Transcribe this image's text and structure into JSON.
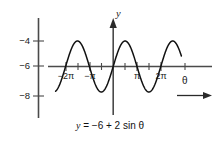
{
  "figure": {
    "caption": "y = −6 + 2 sin θ",
    "caption_parts": {
      "lhs": "y",
      "rhs": " = −6 + 2 sin ",
      "theta": "θ"
    }
  },
  "axes": {
    "y_axis_label": "y",
    "x_axis_label": "θ",
    "y_ticks": [
      {
        "label": "−4",
        "value": -4
      },
      {
        "label": "−6",
        "value": -6
      },
      {
        "label": "−8",
        "value": -8
      }
    ],
    "x_ticks": [
      {
        "label": "−2π",
        "value": -6.2832
      },
      {
        "label": "",
        "value": -4.7124
      },
      {
        "label": "−π",
        "value": -3.1416
      },
      {
        "label": "",
        "value": -1.5708
      },
      {
        "label": "",
        "value": 0
      },
      {
        "label": "",
        "value": 1.5708
      },
      {
        "label": "π",
        "value": 3.1416
      },
      {
        "label": "",
        "value": 4.7124
      },
      {
        "label": "2π",
        "value": 6.2832
      },
      {
        "label": "",
        "value": 7.854
      }
    ]
  },
  "chart_data": {
    "type": "line",
    "title": "",
    "subtitle": "",
    "equation": "y = -6 + 2 sin(theta)",
    "xlabel": "θ",
    "ylabel": "y",
    "xlim": [
      -7.6,
      9.0
    ],
    "ylim": [
      -9.2,
      -2.8
    ],
    "xtick_labels": [
      "−2π",
      "−π",
      "π",
      "2π"
    ],
    "xtick_values": [
      -6.2832,
      -3.1416,
      3.1416,
      6.2832
    ],
    "ytick_labels": [
      "−4",
      "−6",
      "−8"
    ],
    "ytick_values": [
      -4,
      -6,
      -8
    ],
    "grid": false,
    "legend": "none",
    "amplitude": 2,
    "midline": -6,
    "period": 6.2832,
    "phase": 0,
    "series": [
      {
        "name": "y = -6 + 2 sin(theta)",
        "color": "#111111",
        "x": [
          -7.6,
          -7.2,
          -6.8,
          -6.4,
          -6.0,
          -5.6,
          -5.2,
          -4.8,
          -4.4,
          -4.0,
          -3.6,
          -3.2,
          -2.8,
          -2.4,
          -2.0,
          -1.6,
          -1.2,
          -0.8,
          -0.4,
          0.0,
          0.4,
          0.8,
          1.2,
          1.6,
          2.0,
          2.4,
          2.8,
          3.2,
          3.6,
          4.0,
          4.4,
          4.8,
          5.2,
          5.6,
          6.0,
          6.4,
          6.8,
          7.2,
          7.6,
          8.0,
          8.4
        ],
        "y": [
          -7.97,
          -7.66,
          -7.03,
          -6.23,
          -5.42,
          -4.74,
          -4.3,
          -4.06,
          -4.08,
          -4.51,
          -5.11,
          -5.88,
          -6.67,
          -7.35,
          -7.82,
          -8.0,
          -7.86,
          -7.43,
          -6.78,
          -6.0,
          -5.22,
          -4.57,
          -4.14,
          -4.0,
          -4.18,
          -4.65,
          -5.33,
          -6.12,
          -6.89,
          -7.49,
          -7.9,
          -7.99,
          -7.75,
          -7.27,
          -6.56,
          -5.77,
          -4.97,
          -4.34,
          -4.01,
          -4.02,
          -4.36
        ]
      }
    ],
    "annotations": [
      {
        "text": "y = −6 + 2 sin θ",
        "position": "below-axes"
      }
    ]
  }
}
